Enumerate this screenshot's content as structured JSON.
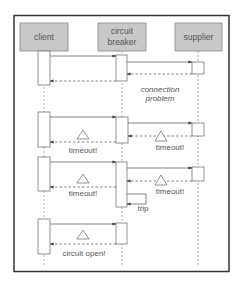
{
  "diagram": {
    "type": "sequence",
    "participants": [
      {
        "id": "client",
        "label_lines": [
          "client"
        ]
      },
      {
        "id": "breaker",
        "label_lines": [
          "circuit",
          "breaker"
        ]
      },
      {
        "id": "supplier",
        "label_lines": [
          "supplier"
        ]
      }
    ],
    "labels": {
      "connection_problem_1": "connection",
      "connection_problem_2": "problem",
      "timeout_client_1": "timeout!",
      "timeout_supplier_1": "timeout!",
      "timeout_client_2": "timeout!",
      "timeout_supplier_2": "timeout!",
      "trip": "trip",
      "circuit_open": "circuit open!"
    },
    "colors": {
      "frame": "#333333",
      "participant_fill": "#c8c8c8",
      "participant_border": "#888888",
      "line": "#777777",
      "text": "#555555"
    },
    "messages": [
      {
        "from": "client",
        "to": "breaker",
        "type": "call"
      },
      {
        "from": "breaker",
        "to": "supplier",
        "type": "call"
      },
      {
        "from": "supplier",
        "to": "breaker",
        "type": "return"
      },
      {
        "from": "breaker",
        "to": "client",
        "type": "return"
      },
      {
        "from": "client",
        "to": "breaker",
        "type": "call"
      },
      {
        "from": "breaker",
        "to": "supplier",
        "type": "call"
      },
      {
        "from": "supplier",
        "to": "breaker",
        "type": "return",
        "label": "timeout!"
      },
      {
        "from": "breaker",
        "to": "client",
        "type": "return",
        "label": "timeout!"
      },
      {
        "from": "client",
        "to": "breaker",
        "type": "call"
      },
      {
        "from": "breaker",
        "to": "supplier",
        "type": "call"
      },
      {
        "from": "supplier",
        "to": "breaker",
        "type": "return",
        "label": "timeout!"
      },
      {
        "from": "breaker",
        "to": "client",
        "type": "return",
        "label": "timeout!"
      },
      {
        "from": "breaker",
        "to": "breaker",
        "type": "self",
        "label": "trip"
      },
      {
        "from": "client",
        "to": "breaker",
        "type": "call"
      },
      {
        "from": "breaker",
        "to": "client",
        "type": "return",
        "label": "circuit open!"
      }
    ]
  }
}
